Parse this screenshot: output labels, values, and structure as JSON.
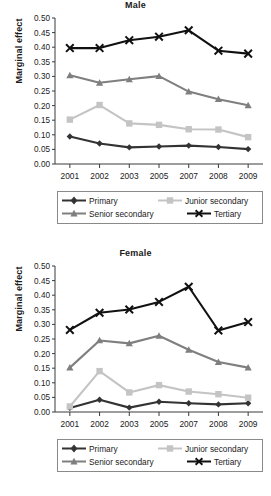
{
  "figure": {
    "ylabel": "Marginal effect",
    "series_names": [
      "Primary",
      "Junior secondary",
      "Senior secondary",
      "Tertiary"
    ],
    "colors": {
      "primary": "#333333",
      "junior_secondary": "#c4c4c4",
      "senior_secondary": "#7f7f7f",
      "tertiary": "#111111",
      "axis": "#3a3a3a",
      "legend_border": "#8a8a8a",
      "background": "#ffffff"
    },
    "markers": {
      "primary": "diamond",
      "junior_secondary": "square",
      "senior_secondary": "triangle",
      "tertiary": "cross-x"
    }
  },
  "legend": {
    "items": [
      {
        "label": "Primary",
        "marker": "diamond",
        "color": "#333333"
      },
      {
        "label": "Junior secondary",
        "marker": "square",
        "color": "#c4c4c4"
      },
      {
        "label": "Senior secondary",
        "marker": "triangle",
        "color": "#7f7f7f"
      },
      {
        "label": "Tertiary",
        "marker": "cross-x",
        "color": "#111111"
      }
    ]
  },
  "chart_data": [
    {
      "type": "line",
      "title": "Male",
      "xlabel": "",
      "ylabel": "Marginal effect",
      "categories": [
        "2001",
        "2002",
        "2003",
        "2005",
        "2007",
        "2008",
        "2009"
      ],
      "ylim": [
        0.0,
        0.5
      ],
      "yticks": [
        "0.00",
        "0.05",
        "0.10",
        "0.15",
        "0.20",
        "0.25",
        "0.30",
        "0.35",
        "0.40",
        "0.45",
        "0.50"
      ],
      "ytick_step": 0.05,
      "grid": false,
      "legend_position": "bottom",
      "series": [
        {
          "name": "Primary",
          "marker": "diamond",
          "color": "#333333",
          "values": [
            0.094,
            0.07,
            0.057,
            0.06,
            0.063,
            0.058,
            0.051
          ]
        },
        {
          "name": "Junior secondary",
          "marker": "square",
          "color": "#c4c4c4",
          "values": [
            0.152,
            0.202,
            0.139,
            0.134,
            0.119,
            0.118,
            0.092
          ]
        },
        {
          "name": "Senior secondary",
          "marker": "triangle",
          "color": "#7f7f7f",
          "values": [
            0.304,
            0.278,
            0.29,
            0.301,
            0.248,
            0.222,
            0.201
          ]
        },
        {
          "name": "Tertiary",
          "marker": "cross-x",
          "color": "#111111",
          "values": [
            0.397,
            0.397,
            0.424,
            0.436,
            0.458,
            0.388,
            0.378
          ]
        }
      ]
    },
    {
      "type": "line",
      "title": "Female",
      "xlabel": "",
      "ylabel": "Marginal effect",
      "categories": [
        "2001",
        "2002",
        "2003",
        "2005",
        "2007",
        "2008",
        "2009"
      ],
      "ylim": [
        0.0,
        0.5
      ],
      "yticks": [
        "0.00",
        "0.05",
        "0.10",
        "0.15",
        "0.20",
        "0.25",
        "0.30",
        "0.35",
        "0.40",
        "0.45",
        "0.50"
      ],
      "ytick_step": 0.05,
      "grid": false,
      "legend_position": "bottom",
      "series": [
        {
          "name": "Primary",
          "marker": "diamond",
          "color": "#333333",
          "values": [
            0.014,
            0.042,
            0.015,
            0.035,
            0.03,
            0.026,
            0.03
          ]
        },
        {
          "name": "Junior secondary",
          "marker": "square",
          "color": "#c4c4c4",
          "values": [
            0.019,
            0.14,
            0.067,
            0.092,
            0.07,
            0.061,
            0.049
          ]
        },
        {
          "name": "Senior secondary",
          "marker": "triangle",
          "color": "#7f7f7f",
          "values": [
            0.152,
            0.245,
            0.235,
            0.261,
            0.213,
            0.171,
            0.152
          ]
        },
        {
          "name": "Tertiary",
          "marker": "cross-x",
          "color": "#111111",
          "values": [
            0.281,
            0.34,
            0.351,
            0.377,
            0.429,
            0.279,
            0.308
          ]
        }
      ]
    }
  ]
}
